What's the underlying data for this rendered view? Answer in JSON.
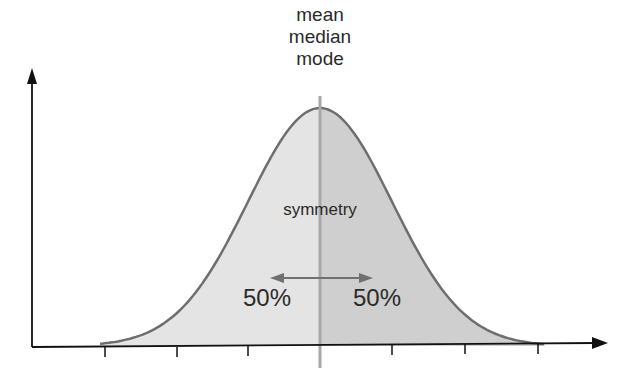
{
  "diagram": {
    "title_lines": [
      "mean",
      "median",
      "mode"
    ],
    "center_label": "symmetry",
    "left_percent": "50%",
    "right_percent": "50%",
    "colors": {
      "left_fill": "#e4e4e4",
      "right_fill": "#cfcfcf",
      "curve": "#6e6e6e",
      "center_line": "#a8a8a8",
      "axis": "#111111",
      "arrow": "#707070"
    }
  },
  "chart_data": {
    "type": "area",
    "xlabel": "",
    "ylabel": "",
    "x_ticks": [
      -3,
      -2,
      -1,
      0,
      1,
      2,
      3
    ],
    "annotations": [
      "mean",
      "median",
      "mode",
      "symmetry",
      "50%",
      "50%"
    ],
    "left_area_percent": 50,
    "right_area_percent": 50
  }
}
